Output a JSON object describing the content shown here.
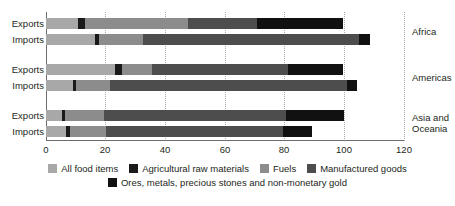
{
  "chart_data": {
    "type": "bar",
    "orientation": "horizontal",
    "stacked": true,
    "title": "",
    "xlabel": "",
    "ylabel": "",
    "xlim": [
      0,
      120
    ],
    "xticks": [
      0,
      20,
      40,
      60,
      80,
      100,
      120
    ],
    "xtick_labels": [
      "0",
      "20",
      "40",
      "60",
      "80",
      "100",
      "120"
    ],
    "grid": "vertical dotted",
    "legend_position": "bottom",
    "series": [
      {
        "name": "All food items",
        "color": "#a8a8a8",
        "values": [
          10.7,
          16.4,
          23.1,
          9.0,
          5.4,
          6.7
        ]
      },
      {
        "name": "Agricultural raw materials",
        "color": "#1a1a1a",
        "values": [
          2.3,
          1.3,
          2.3,
          1.0,
          1.0,
          1.3
        ]
      },
      {
        "name": "Fuels",
        "color": "#8c8c8c",
        "values": [
          34.6,
          14.8,
          10.1,
          11.4,
          13.1,
          12.1
        ]
      },
      {
        "name": "Manufactured goods",
        "color": "#4d4d4d",
        "values": [
          23.1,
          72.5,
          45.6,
          79.5,
          60.9,
          59.4
        ]
      },
      {
        "name": "Ores, metals, precious stones and non-monetary gold",
        "color": "#111111",
        "values": [
          28.8,
          3.7,
          18.4,
          3.4,
          19.5,
          9.7
        ]
      }
    ],
    "groups": [
      {
        "region": "Africa",
        "rows": [
          "Exports",
          "Imports"
        ],
        "totals": [
          99.5,
          108.7
        ]
      },
      {
        "region": "Americas",
        "rows": [
          "Exports",
          "Imports"
        ],
        "totals": [
          99.5,
          104.3
        ]
      },
      {
        "region": "Asia and Oceania",
        "rows": [
          "Exports",
          "Imports"
        ],
        "totals": [
          99.9,
          89.2
        ]
      }
    ]
  },
  "rows": [
    {
      "label": "Exports",
      "region": "Africa",
      "segments": [
        10.7,
        2.3,
        34.6,
        23.1,
        28.8
      ]
    },
    {
      "label": "Imports",
      "region": "Africa",
      "segments": [
        16.4,
        1.3,
        14.8,
        72.5,
        3.7
      ]
    },
    {
      "label": "Exports",
      "region": "Americas",
      "segments": [
        23.1,
        2.3,
        10.1,
        45.6,
        18.4
      ]
    },
    {
      "label": "Imports",
      "region": "Americas",
      "segments": [
        9.0,
        1.0,
        11.4,
        79.5,
        3.4
      ]
    },
    {
      "label": "Exports",
      "region": "Asia and Oceania",
      "segments": [
        5.4,
        1.0,
        13.1,
        60.9,
        19.5
      ]
    },
    {
      "label": "Imports",
      "region": "Asia and Oceania",
      "segments": [
        6.7,
        1.3,
        12.1,
        59.4,
        9.7
      ]
    }
  ],
  "row_labels": {
    "r0": "Exports",
    "r1": "Imports",
    "r2": "Exports",
    "r3": "Imports",
    "r4": "Exports",
    "r5": "Imports"
  },
  "region_labels": {
    "africa": "Africa",
    "americas": "Americas",
    "asia_line1": "Asia and",
    "asia_line2": "Oceania"
  },
  "ticks": {
    "t0": "0",
    "t1": "20",
    "t2": "40",
    "t3": "60",
    "t4": "80",
    "t5": "100",
    "t6": "120"
  },
  "legend": {
    "items": [
      {
        "label": "All food items",
        "color": "#a8a8a8"
      },
      {
        "label": "Agricultural raw materials",
        "color": "#1a1a1a"
      },
      {
        "label": "Fuels",
        "color": "#8c8c8c"
      },
      {
        "label": "Manufactured goods",
        "color": "#4d4d4d"
      },
      {
        "label": "Ores, metals, precious stones and non-monetary gold",
        "color": "#111111"
      }
    ],
    "l0": "All food items",
    "l1": "Agricultural raw materials",
    "l2": "Fuels",
    "l3": "Manufactured goods",
    "l4": "Ores, metals, precious stones and non-monetary gold"
  }
}
